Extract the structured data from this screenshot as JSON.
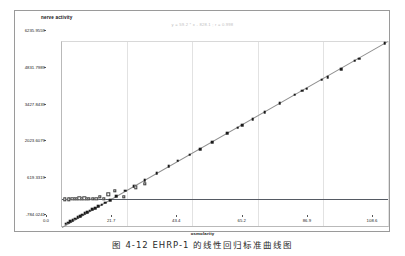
{
  "chart_data": {
    "type": "scatter",
    "title": "",
    "annotation": "y = 59.2 * x - 828.1 ; r = 0.998",
    "xlabel": "osmolarity",
    "ylabel": "nerve activity",
    "xlim": [
      0.0,
      108.6
    ],
    "ylim": [
      -784.0241,
      6235.9559
    ],
    "grid": false,
    "legend_position": "none",
    "xticks": [
      "0.0",
      "21.7",
      "43.4",
      "65.2",
      "86.9",
      "108.6"
    ],
    "xtick_values": [
      0.0,
      21.7,
      43.4,
      65.2,
      86.9,
      108.6
    ],
    "yticks": [
      "6235.9559",
      "4831.7989",
      "3427.8439",
      "2023.6079",
      "619.3319",
      "-784.0241"
    ],
    "ytick_values": [
      6235.9559,
      4831.7989,
      3427.8439,
      2023.6079,
      619.3319,
      -784.0241
    ],
    "reference_line": {
      "label": "baseline",
      "y": 260.0,
      "color": "#555a63"
    },
    "fit_line": {
      "label": "regression",
      "color": "#8e8e8e",
      "x0": 0.0,
      "y0": -828.0,
      "x1": 108.6,
      "y1": 6270.0
    },
    "series": [
      {
        "name": "measured",
        "marker": "filled-square",
        "color": "#1b1b1b",
        "points": [
          [
            1.2,
            -700.0
          ],
          [
            2.0,
            -660.0
          ],
          [
            2.8,
            -610.0
          ],
          [
            3.6,
            -560.0
          ],
          [
            4.4,
            -505.0
          ],
          [
            5.2,
            -455.0
          ],
          [
            6.0,
            -400.0
          ],
          [
            6.8,
            -350.0
          ],
          [
            7.6,
            -300.0
          ],
          [
            8.4,
            -250.0
          ],
          [
            9.2,
            -200.0
          ],
          [
            10.0,
            -150.0
          ],
          [
            11.0,
            -95.0
          ],
          [
            12.0,
            -40.0
          ],
          [
            13.2,
            30.0
          ],
          [
            14.4,
            100.0
          ],
          [
            16.0,
            210.0
          ],
          [
            18.0,
            360.0
          ],
          [
            21.0,
            560.0
          ],
          [
            24.0,
            740.0
          ],
          [
            27.5,
            960.0
          ],
          [
            31.5,
            1230.0
          ],
          [
            35.5,
            1500.0
          ],
          [
            38.5,
            1700.0
          ],
          [
            42.5,
            1930.0
          ],
          [
            46.0,
            2140.0
          ],
          [
            50.0,
            2420.0
          ],
          [
            55.0,
            2760.0
          ],
          [
            58.5,
            2960.0
          ],
          [
            60.0,
            3060.0
          ],
          [
            63.5,
            3300.0
          ],
          [
            67.5,
            3550.0
          ],
          [
            72.5,
            3900.0
          ],
          [
            77.5,
            4230.0
          ],
          [
            80.0,
            4380.0
          ],
          [
            81.5,
            4460.0
          ],
          [
            86.5,
            4790.0
          ],
          [
            88.5,
            4900.0
          ],
          [
            93.0,
            5200.0
          ],
          [
            97.5,
            5520.0
          ],
          [
            99.0,
            5600.0
          ],
          [
            107.5,
            6200.0
          ]
        ]
      },
      {
        "name": "control",
        "marker": "open-square",
        "color": "#3a3a3a",
        "points": [
          [
            1.0,
            230.0
          ],
          [
            2.2,
            240.0
          ],
          [
            3.4,
            255.0
          ],
          [
            4.2,
            250.0
          ],
          [
            5.0,
            265.0
          ],
          [
            5.8,
            270.0
          ],
          [
            6.6,
            260.0
          ],
          [
            7.4,
            268.0
          ],
          [
            8.2,
            255.0
          ],
          [
            9.0,
            262.0
          ],
          [
            10.2,
            250.0
          ],
          [
            11.4,
            258.0
          ],
          [
            12.6,
            340.0
          ],
          [
            14.0,
            255.0
          ],
          [
            15.4,
            430.0
          ],
          [
            17.5,
            560.0
          ],
          [
            20.5,
            330.0
          ],
          [
            24.5,
            690.0
          ],
          [
            27.5,
            830.0
          ]
        ]
      }
    ]
  },
  "caption": "图 4-12 EHRP-1  的线性回归标准曲线图"
}
